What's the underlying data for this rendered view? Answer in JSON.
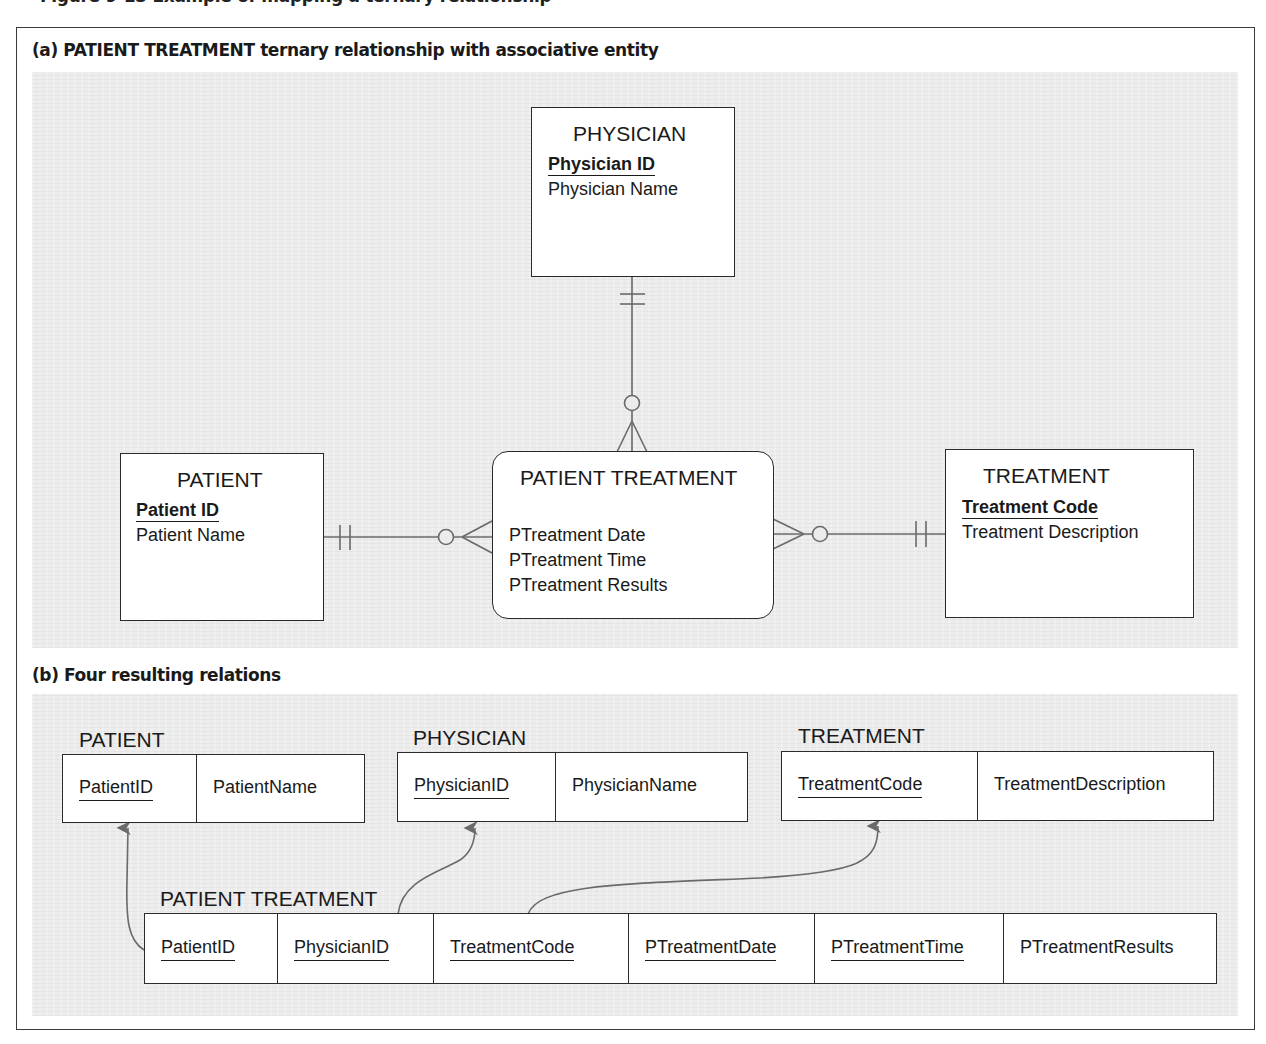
{
  "clipped_header": "Figure 9-13  Example of mapping a ternary relationship",
  "section_a": {
    "title": "(a) PATIENT TREATMENT ternary relationship with associative entity",
    "entities": {
      "physician": {
        "name": "PHYSICIAN",
        "pk": "Physician ID",
        "attrs": [
          "Physician Name"
        ]
      },
      "patient": {
        "name": "PATIENT",
        "pk": "Patient ID",
        "attrs": [
          "Patient Name"
        ]
      },
      "treatment": {
        "name": "TREATMENT",
        "pk": "Treatment Code",
        "attrs": [
          "Treatment Description"
        ]
      },
      "patient_treatment": {
        "name": "PATIENT TREATMENT",
        "attrs": [
          "PTreatment Date",
          "PTreatment Time",
          "PTreatment Results"
        ]
      }
    },
    "relationships": [
      {
        "from": "PHYSICIAN",
        "to": "PATIENT TREATMENT",
        "from_cardinality": "mandatory-one",
        "to_cardinality": "optional-many"
      },
      {
        "from": "PATIENT",
        "to": "PATIENT TREATMENT",
        "from_cardinality": "mandatory-one",
        "to_cardinality": "optional-many"
      },
      {
        "from": "TREATMENT",
        "to": "PATIENT TREATMENT",
        "from_cardinality": "mandatory-one",
        "to_cardinality": "optional-many"
      }
    ]
  },
  "section_b": {
    "title": "(b) Four resulting relations",
    "relations": {
      "patient": {
        "name": "PATIENT",
        "columns": [
          {
            "label": "PatientID",
            "key": true
          },
          {
            "label": "PatientName",
            "key": false
          }
        ]
      },
      "physician": {
        "name": "PHYSICIAN",
        "columns": [
          {
            "label": "PhysicianID",
            "key": true
          },
          {
            "label": "PhysicianName",
            "key": false
          }
        ]
      },
      "treatment": {
        "name": "TREATMENT",
        "columns": [
          {
            "label": "TreatmentCode",
            "key": true
          },
          {
            "label": "TreatmentDescription",
            "key": false
          }
        ]
      },
      "patient_treatment": {
        "name": "PATIENT TREATMENT",
        "columns": [
          {
            "label": "PatientID",
            "key": true
          },
          {
            "label": "PhysicianID",
            "key": true
          },
          {
            "label": "TreatmentCode",
            "key": true
          },
          {
            "label": "PTreatmentDate",
            "key": true
          },
          {
            "label": "PTreatmentTime",
            "key": true
          },
          {
            "label": "PTreatmentResults",
            "key": false
          }
        ]
      }
    },
    "foreign_keys": [
      {
        "from": "PATIENT TREATMENT.PatientID",
        "to": "PATIENT.PatientID"
      },
      {
        "from": "PATIENT TREATMENT.PhysicianID",
        "to": "PHYSICIAN.PhysicianID"
      },
      {
        "from": "PATIENT TREATMENT.TreatmentCode",
        "to": "TREATMENT.TreatmentCode"
      }
    ]
  },
  "colors": {
    "panel_bg": "#ececec",
    "line": "#2a2a2a",
    "connector": "#6a6a6a",
    "box_bg": "#ffffff"
  }
}
